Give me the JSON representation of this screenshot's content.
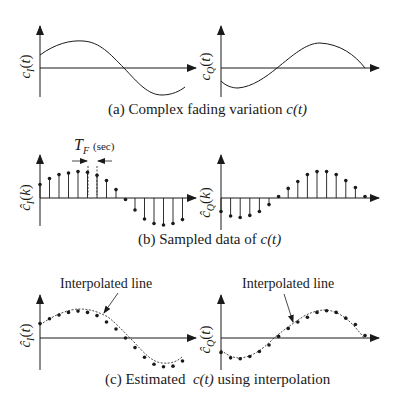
{
  "panels": {
    "a": {
      "caption_prefix": "(a) Complex fading variation ",
      "caption_math": "c(t)",
      "left_ylabel": "c_I(t)",
      "right_ylabel": "c_Q(t)"
    },
    "b": {
      "caption_prefix": "(b) Sampled data of ",
      "caption_math": "c(t)",
      "left_ylabel": "ĉ_I(k)",
      "right_ylabel": "ĉ_Q(k)",
      "period_label": "T_F",
      "period_unit": "(sec)"
    },
    "c": {
      "caption_prefix": "(c) Estimated  ",
      "caption_math": "c(t)",
      "caption_suffix": " using interpolation",
      "left_ylabel": "ĉ_I(t)",
      "right_ylabel": "ĉ_Q(t)",
      "left_annotation": "Interpolated line",
      "right_annotation": "Interpolated line"
    }
  },
  "labels": {
    "cI_t_main": "c",
    "cI_t_sub": "I",
    "cQ_t_sub": "Q",
    "arg_t": "(t)",
    "arg_k": "(k)",
    "hat": "^",
    "TF_main": "T",
    "TF_sub": "F",
    "TF_unit": "(sec)"
  },
  "chart_data": [
    {
      "type": "line",
      "title": "(a) Complex fading variation c(t) — in-phase",
      "ylabel": "c_I(t)",
      "x": [
        0,
        1,
        2,
        3,
        4,
        5,
        6,
        7,
        8,
        9,
        10,
        11,
        12,
        13,
        14,
        15
      ],
      "values": [
        0.45,
        0.65,
        0.8,
        0.88,
        0.92,
        0.88,
        0.75,
        0.55,
        0.3,
        0.0,
        -0.3,
        -0.6,
        -0.82,
        -0.92,
        -0.9,
        -0.72
      ]
    },
    {
      "type": "line",
      "title": "(a) Complex fading variation c(t) — quadrature",
      "ylabel": "c_Q(t)",
      "x": [
        0,
        1,
        2,
        3,
        4,
        5,
        6,
        7,
        8,
        9,
        10,
        11,
        12,
        13,
        14,
        15
      ],
      "values": [
        -0.45,
        -0.65,
        -0.7,
        -0.6,
        -0.45,
        -0.25,
        0.0,
        0.25,
        0.5,
        0.72,
        0.85,
        0.88,
        0.82,
        0.65,
        0.4,
        0.1
      ]
    },
    {
      "type": "bar",
      "title": "(b) Sampled data of c(t) — in-phase",
      "ylabel": "ĉ_I(k)",
      "x": [
        0,
        1,
        2,
        3,
        4,
        5,
        6,
        7,
        8,
        9,
        10,
        11,
        12,
        13,
        14,
        15,
        16,
        17
      ],
      "values": [
        0.45,
        0.65,
        0.78,
        0.83,
        0.88,
        0.86,
        0.76,
        0.58,
        0.28,
        -0.05,
        -0.4,
        -0.7,
        -0.85,
        -0.9,
        -0.85,
        -0.72
      ],
      "annotation": "T_F (sec)"
    },
    {
      "type": "bar",
      "title": "(b) Sampled data of c(t) — quadrature",
      "ylabel": "ĉ_Q(k)",
      "x": [
        0,
        1,
        2,
        3,
        4,
        5,
        6,
        7,
        8,
        9,
        10,
        11,
        12,
        13,
        14,
        15
      ],
      "values": [
        -0.45,
        -0.6,
        -0.65,
        -0.58,
        -0.45,
        -0.22,
        0.05,
        0.32,
        0.55,
        0.78,
        0.88,
        0.88,
        0.78,
        0.58,
        0.35,
        0.05
      ]
    },
    {
      "type": "scatter",
      "title": "(c) Estimated c(t) using interpolation — in-phase",
      "ylabel": "ĉ_I(t)",
      "annotation": "Interpolated line",
      "values": [
        0.45,
        0.6,
        0.72,
        0.8,
        0.84,
        0.8,
        0.7,
        0.5,
        0.28,
        0.0,
        -0.3,
        -0.6,
        -0.82,
        -0.9,
        -0.88,
        -0.72
      ]
    },
    {
      "type": "scatter",
      "title": "(c) Estimated c(t) using interpolation — quadrature",
      "ylabel": "ĉ_Q(t)",
      "annotation": "Interpolated line",
      "values": [
        -0.45,
        -0.62,
        -0.65,
        -0.58,
        -0.42,
        -0.22,
        0.05,
        0.3,
        0.5,
        0.65,
        0.8,
        0.85,
        0.8,
        0.62,
        0.42,
        0.08
      ]
    }
  ]
}
